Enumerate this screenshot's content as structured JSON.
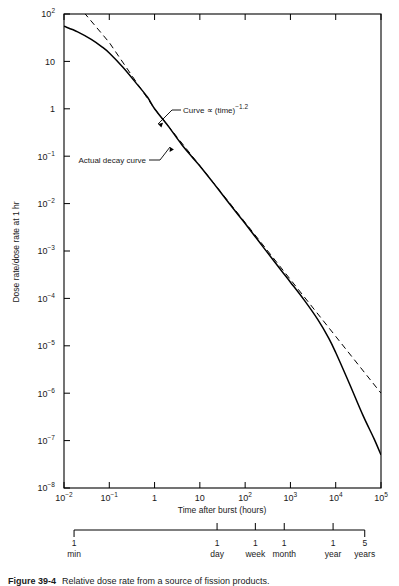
{
  "figure": {
    "y_axis_title": "Dose rate/dose rate at 1 hr",
    "x_axis_title": "Time after burst (hours)"
  },
  "caption": {
    "label": "Figure 39-4",
    "text": "Relative dose rate from a source of fission products."
  },
  "annotations": {
    "power_law": {
      "text_main": "Curve ∝ (time)",
      "text_exp": "−1.2"
    },
    "actual": {
      "text": "Actual decay curve"
    }
  },
  "y_ticks": [
    {
      "label": "10",
      "exp": "2",
      "value": 2
    },
    {
      "label": "10",
      "exp": "",
      "value": 1
    },
    {
      "label": "1",
      "exp": "",
      "value": 0
    },
    {
      "label": "10",
      "exp": "−1",
      "value": -1
    },
    {
      "label": "10",
      "exp": "−2",
      "value": -2
    },
    {
      "label": "10",
      "exp": "−3",
      "value": -3
    },
    {
      "label": "10",
      "exp": "−4",
      "value": -4
    },
    {
      "label": "10",
      "exp": "−5",
      "value": -5
    },
    {
      "label": "10",
      "exp": "−6",
      "value": -6
    },
    {
      "label": "10",
      "exp": "−7",
      "value": -7
    },
    {
      "label": "10",
      "exp": "−8",
      "value": -8
    }
  ],
  "x_ticks": [
    {
      "label": "10",
      "exp": "−2",
      "value": -2
    },
    {
      "label": "10",
      "exp": "−1",
      "value": -1
    },
    {
      "label": "1",
      "exp": "",
      "value": 0
    },
    {
      "label": "10",
      "exp": "",
      "value": 1
    },
    {
      "label": "10",
      "exp": "2",
      "value": 2
    },
    {
      "label": "10",
      "exp": "3",
      "value": 3
    },
    {
      "label": "10",
      "exp": "4",
      "value": 4
    },
    {
      "label": "10",
      "exp": "5",
      "value": 5
    }
  ],
  "secondary_axis": [
    {
      "num": "1",
      "unit": "min",
      "value": -1.778
    },
    {
      "num": "1",
      "unit": "day",
      "value": 1.3802
    },
    {
      "num": "1",
      "unit": "week",
      "value": 2.2253
    },
    {
      "num": "1",
      "unit": "month",
      "value": 2.8633
    },
    {
      "num": "1",
      "unit": "year",
      "value": 3.9421
    },
    {
      "num": "5",
      "unit": "years",
      "value": 4.6411
    }
  ],
  "chart_data": {
    "type": "line",
    "title": "",
    "xlabel": "Time after burst (hours)",
    "ylabel": "Dose rate/dose rate at 1 hr",
    "xscale": "log",
    "yscale": "log",
    "xlim": [
      0.01,
      100000
    ],
    "ylim": [
      1e-08,
      100
    ],
    "grid": false,
    "legend": "none",
    "series": [
      {
        "name": "Actual decay curve",
        "style": "solid",
        "x": [
          0.01,
          0.02,
          0.04,
          0.07,
          0.1,
          0.2,
          0.4,
          0.7,
          1,
          2,
          4,
          7,
          10,
          20,
          40,
          70,
          100,
          200,
          400,
          700,
          1000,
          2000,
          4000,
          7000,
          10000,
          20000,
          40000,
          70000,
          100000
        ],
        "y": [
          55,
          42,
          29,
          20,
          15,
          7.5,
          3.4,
          1.75,
          1.0,
          0.43,
          0.175,
          0.092,
          0.062,
          0.027,
          0.0115,
          0.0058,
          0.0038,
          0.0016,
          0.00068,
          0.00034,
          0.00022,
          9.3e-05,
          3.6e-05,
          1.45e-05,
          7.2e-06,
          1.6e-06,
          3.4e-07,
          1.1e-07,
          5e-08
        ]
      },
      {
        "name": "Curve ∝ (time)^-1.2",
        "style": "dashed",
        "x": [
          0.02,
          0.1,
          1,
          10,
          100,
          1000,
          10000,
          100000
        ],
        "y": [
          155,
          25,
          1.0,
          0.063,
          0.004,
          0.00025,
          1.58e-05,
          1e-06
        ]
      }
    ],
    "annotations": [
      {
        "text": "Curve ∝ (time)^-1.2",
        "points_to_x": 4.5,
        "points_to_y": 0.16
      },
      {
        "text": "Actual decay curve",
        "points_to_x": 6.5,
        "points_to_y": 0.085
      }
    ]
  },
  "colors": {
    "axis": "#000000",
    "curve": "#000000",
    "background": "#ffffff"
  }
}
